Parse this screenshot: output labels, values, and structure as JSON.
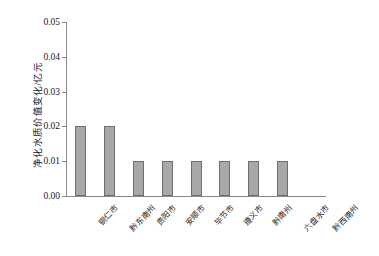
{
  "chart_data": {
    "type": "bar",
    "title": "",
    "xlabel": "",
    "ylabel": "净化水质价值变化/亿元",
    "categories": [
      "铜仁市",
      "黔东南州",
      "贵阳市",
      "安顺市",
      "毕节市",
      "遵义市",
      "黔南州",
      "六盘水市",
      "黔西南州"
    ],
    "values": [
      0.02,
      0.02,
      0.01,
      0.01,
      0.01,
      0.01,
      0.01,
      0.01,
      0.0
    ],
    "ylim": [
      0.0,
      0.05
    ],
    "ytick_labels": [
      "0.00",
      "0.01",
      "0.02",
      "0.03",
      "0.04",
      "0.05"
    ],
    "ytick_values": [
      0.0,
      0.01,
      0.02,
      0.03,
      0.04,
      0.05
    ],
    "grid": false,
    "legend": null,
    "bar_fill_color": "#a8a8a8",
    "bar_edge_color": "#6e6e6e",
    "axis_color": "#8a8a8a",
    "background_color": "#ffffff"
  }
}
